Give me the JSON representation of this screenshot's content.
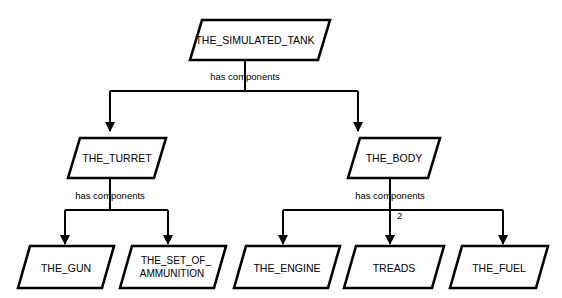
{
  "diagram": {
    "type": "tree-decomposition",
    "background_color": "#ffffff",
    "line_color": "#000000",
    "node_fill": "#ffffff",
    "node_shape": "parallelogram",
    "nodes": [
      {
        "id": "tank",
        "label": "THE_SIMULATED_TANK",
        "level": 0
      },
      {
        "id": "turret",
        "label": "THE_TURRET",
        "level": 1
      },
      {
        "id": "body",
        "label": "THE_BODY",
        "level": 1
      },
      {
        "id": "gun",
        "label": "THE_GUN",
        "level": 2
      },
      {
        "id": "ammo_line1",
        "label": "THE_SET_OF_",
        "level": 2
      },
      {
        "id": "ammo_line2",
        "label": "AMMUNITION",
        "level": 2
      },
      {
        "id": "engine",
        "label": "THE_ENGINE",
        "level": 2
      },
      {
        "id": "treads",
        "label": "TREADS",
        "level": 2
      },
      {
        "id": "fuel",
        "label": "THE_FUEL",
        "level": 2
      }
    ],
    "edge_labels": {
      "tank_relation": "has components",
      "turret_relation": "has components",
      "body_relation": "has components"
    },
    "multiplicities": {
      "treads": "2"
    }
  }
}
